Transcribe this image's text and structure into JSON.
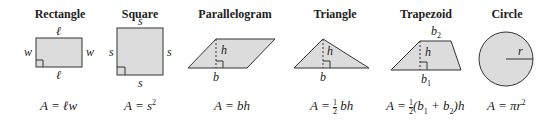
{
  "shapes": [
    {
      "title": "Rectangle",
      "labels": {
        "top": "ℓ",
        "bottom": "ℓ",
        "left": "w",
        "right": "w"
      },
      "formula": "A = ℓw"
    },
    {
      "title": "Square",
      "labels": {
        "top": "s",
        "bottom": "s",
        "left": "s",
        "right": "s"
      },
      "formula_prefix": "A = s",
      "formula_exp": "2"
    },
    {
      "title": "Parallelogram",
      "labels": {
        "height": "h",
        "base": "b"
      },
      "formula": "A = bh"
    },
    {
      "title": "Triangle",
      "labels": {
        "height": "h",
        "base": "b"
      },
      "formula_prefix": "A = ",
      "fraction_num": "1",
      "fraction_den": "2",
      "formula_suffix": " bh"
    },
    {
      "title": "Trapezoid",
      "labels": {
        "top": "b",
        "top_sub": "2",
        "height": "h",
        "bottom": "b",
        "bottom_sub": "1"
      },
      "formula_prefix": "A = ",
      "fraction_num": "1",
      "fraction_den": "2",
      "formula_suffix": "(b",
      "s1": "1",
      "mid": " + b",
      "s2": "2",
      "end": ")h"
    },
    {
      "title": "Circle",
      "labels": {
        "radius": "r"
      },
      "formula_prefix": "A = πr",
      "formula_exp": "2"
    }
  ],
  "colors": {
    "fill": "#dcdcdc",
    "stroke": "#333333"
  }
}
